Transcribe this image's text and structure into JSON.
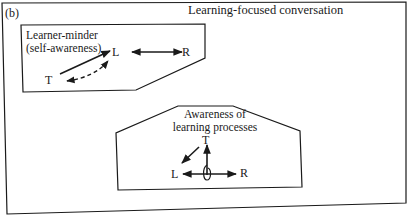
{
  "panel_label": "(b)",
  "title": "Learning-focused conversation",
  "boxes": [
    {
      "label_line1": "Learner-minder",
      "label_line2": "(self-awareness)",
      "nodes": {
        "T": "T",
        "L": "L",
        "R": "R"
      },
      "arrows": [
        "T to L (solid)",
        "T to L (dashed, bidirectional curved)",
        "L to R (bidirectional)"
      ]
    },
    {
      "label_line1": "Awareness of",
      "label_line2": "learning processes",
      "nodes": {
        "T": "T",
        "L": "L",
        "R": "R"
      },
      "arrows": [
        "T to L (diagonal)",
        "vertical up to T with loop",
        "L to R (bidirectional)"
      ]
    }
  ],
  "colors": {
    "line": "#1a1a1a",
    "background": "#ffffff"
  }
}
